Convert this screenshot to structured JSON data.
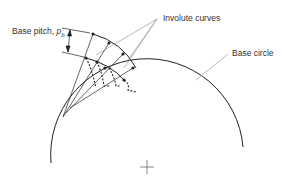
{
  "diagram": {
    "labels": {
      "base_pitch": "Base pitch, ",
      "base_pitch_symbol": "p",
      "base_pitch_sub": "b",
      "involute_curves": "Involute curves",
      "base_circle": "Base circle"
    },
    "colors": {
      "line": "#222222",
      "leader": "#999999",
      "text": "#333333"
    }
  }
}
